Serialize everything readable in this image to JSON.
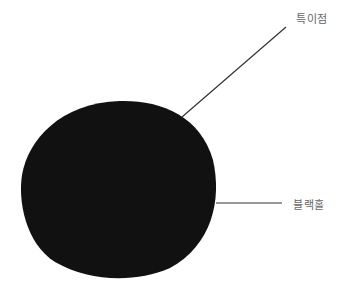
{
  "diagram": {
    "labels": {
      "singularity": "특이점",
      "black_hole": "블랙홀"
    },
    "colors": {
      "body": "#111111",
      "line": "#333333",
      "text": "#666666"
    }
  }
}
